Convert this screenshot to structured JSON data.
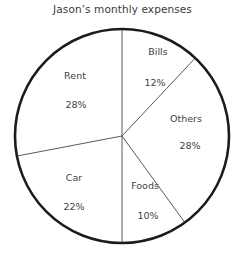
{
  "chart_data": {
    "type": "pie",
    "title": "Jason’s monthly expenses",
    "xlabel": "",
    "ylabel": "",
    "legend_position": "none",
    "grid": false,
    "start_angle_deg": 0,
    "direction": "clockwise",
    "unit": "%",
    "categories": [
      "Bills",
      "Others",
      "Foods",
      "Car",
      "Rent"
    ],
    "values": [
      12,
      28,
      10,
      22,
      28
    ],
    "slices": [
      {
        "name": "Bills",
        "value": 12,
        "value_label": "12%",
        "start_deg": 0,
        "end_deg": 43.2,
        "label_x": 158,
        "label_y": 46,
        "value_x": 155,
        "value_y": 77,
        "fill": "#ffffff"
      },
      {
        "name": "Others",
        "value": 28,
        "value_label": "28%",
        "start_deg": 43.2,
        "end_deg": 144.0,
        "label_x": 186,
        "label_y": 113,
        "value_x": 190,
        "value_y": 140,
        "fill": "#ffffff"
      },
      {
        "name": "Foods",
        "value": 10,
        "value_label": "10%",
        "start_deg": 144.0,
        "end_deg": 180.0,
        "label_x": 145,
        "label_y": 180,
        "value_x": 148,
        "value_y": 210,
        "fill": "#ffffff"
      },
      {
        "name": "Car",
        "value": 22,
        "value_label": "22%",
        "start_deg": 180.0,
        "end_deg": 259.2,
        "label_x": 74,
        "label_y": 172,
        "value_x": 74,
        "value_y": 201,
        "fill": "#ffffff"
      },
      {
        "name": "Rent",
        "value": 28,
        "value_label": "28%",
        "start_deg": 259.2,
        "end_deg": 360.0,
        "label_x": 75,
        "label_y": 70,
        "value_x": 76,
        "value_y": 99,
        "fill": "#ffffff"
      }
    ],
    "geometry": {
      "center_x": 122,
      "center_y": 136,
      "radius": 107
    },
    "colors": {
      "outline": "#1c1c1c",
      "divider": "#5a5a5a",
      "text": "#3f3f3f",
      "background": "#ffffff"
    }
  }
}
